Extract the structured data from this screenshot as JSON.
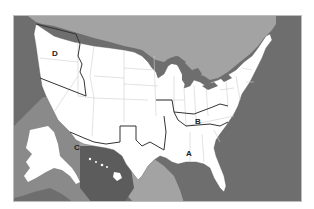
{
  "map": {
    "title": "United States regions map",
    "colors": {
      "ocean": "#6e6e6e",
      "foreign_land": "#a3a3a3",
      "us_land": "#ffffff",
      "state_border": "#cfcfcf",
      "region_border": "#333333",
      "inset_panel": "#8a8a8a",
      "inset_dark": "#5c5c5c"
    },
    "labels": [
      {
        "id": "A",
        "text": "A"
      },
      {
        "id": "B",
        "text": "B"
      },
      {
        "id": "C",
        "text": "C"
      },
      {
        "id": "D",
        "text": "D"
      }
    ],
    "areas": {
      "canada": "Canada",
      "mexico": "Mexico",
      "alaska_inset": "Alaska",
      "hawaii_inset": "Hawaii"
    }
  }
}
